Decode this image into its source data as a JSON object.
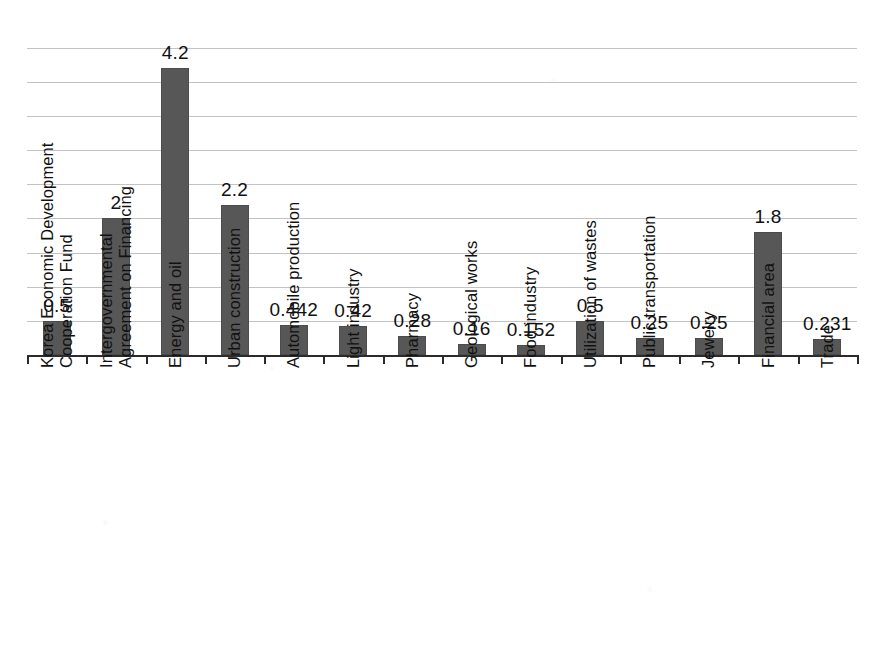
{
  "chart_data": {
    "type": "bar",
    "title": "",
    "subtitle": "",
    "xlabel": "",
    "ylabel": "",
    "ylim": [
      0,
      4.5
    ],
    "grid": true,
    "gridline_values": [
      0.5,
      1.0,
      1.5,
      2.0,
      2.5,
      3.0,
      3.5,
      4.0,
      4.5
    ],
    "legend": "none",
    "tick_labels_y": [],
    "orientation": "vertical",
    "bar_color": "#575757",
    "categories": [
      "Korea Economic Development Cooperation Fund",
      "Intergovernmental Agreement on Financing",
      "Energy and oil",
      "Urban construction",
      "Automobile production",
      "Light industry",
      "Pharmacy",
      "Geological works",
      "Food industry",
      "Utilization of wastes",
      "Public transportation",
      "Jewelry",
      "Financial area",
      "Trade"
    ],
    "category_lines": [
      [
        "Korea Economic Development",
        "Cooperation Fund"
      ],
      [
        "Intergovernmental",
        "Agreement on Financing"
      ],
      [
        "Energy and oil"
      ],
      [
        "Urban construction"
      ],
      [
        "Automobile production"
      ],
      [
        "Light industry"
      ],
      [
        "Pharmacy"
      ],
      [
        "Geological works"
      ],
      [
        "Food industry"
      ],
      [
        "Utilization of wastes"
      ],
      [
        "Public transportation"
      ],
      [
        "Jewelry"
      ],
      [
        "Financial area"
      ],
      [
        "Trade"
      ]
    ],
    "values": [
      0.5,
      2,
      4.2,
      2.2,
      0.442,
      0.42,
      0.28,
      0.16,
      0.152,
      0.5,
      0.25,
      0.25,
      1.8,
      0.231
    ],
    "data_labels": [
      "0.5",
      "2",
      "4.2",
      "2.2",
      "0.442",
      "0.42",
      "0.28",
      "0.16",
      "0.152",
      "0.5",
      "0.25",
      "0.25",
      "1.8",
      "0.231"
    ]
  }
}
